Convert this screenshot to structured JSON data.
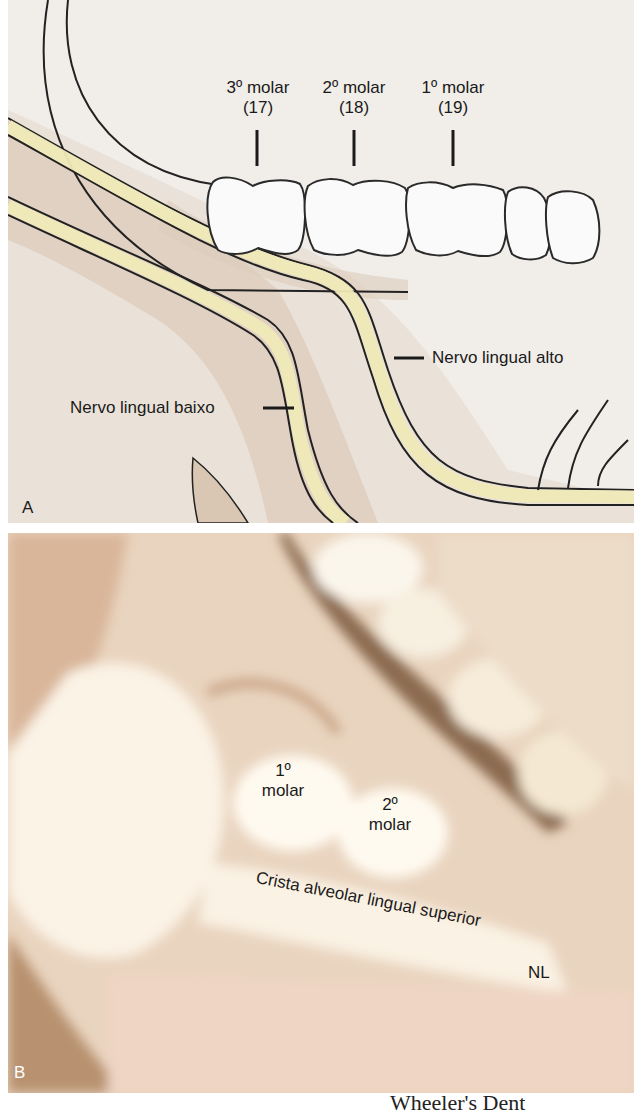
{
  "figure": {
    "panel_a": {
      "letter": "A",
      "tooth_labels": [
        {
          "name": "3º molar",
          "number": "(17)"
        },
        {
          "name": "2º molar",
          "number": "(18)"
        },
        {
          "name": "1º molar",
          "number": "(19)"
        }
      ],
      "nerve_high_label": "Nervo lingual alto",
      "nerve_low_label": "Nervo lingual baixo",
      "colors": {
        "background": "#f1ede9",
        "tissue": "#dccbbb",
        "nerve": "#efe9b8",
        "outline": "#222222",
        "tooth": "#fafafa"
      }
    },
    "panel_b": {
      "letter": "B",
      "first_molar": {
        "line1": "1º",
        "line2": "molar"
      },
      "second_molar": {
        "line1": "2º",
        "line2": "molar"
      },
      "crest_label": "Crista alveolar lingual superior",
      "nl_label": "NL",
      "colors": {
        "tissue": "#e9d4bf",
        "highlight": "#fbf5ea",
        "shadow": "#8b6a4f"
      }
    },
    "footer_partial": "Wheeler's Dent"
  }
}
